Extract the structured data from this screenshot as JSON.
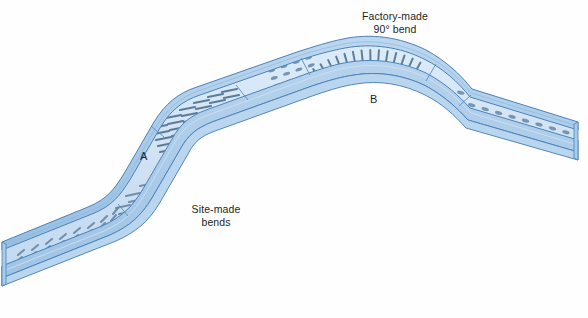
{
  "figure": {
    "title_visible": false,
    "background_color": "#fefefe",
    "labels": {
      "factory_bend_line1": "Factory-made",
      "factory_bend_line2": "90° bend",
      "site_bends_line1": "Site-made",
      "site_bends_line2": "bends",
      "point_a": "A",
      "point_b": "B"
    },
    "colors": {
      "tray_base_fill": "#cfe1f3",
      "tray_base_fill_light": "#dceaf7",
      "tray_rail_fill": "#aecde9",
      "tray_rail_fill_dark": "#9cc2e4",
      "tray_outline": "#4a82b8",
      "tray_outline_dark": "#3b6fa3",
      "slot_color": "#5c7f9e",
      "slot_color_dark": "#4a6b88",
      "joint_line": "#5d93c4",
      "text_color": "#1e1e20"
    },
    "geometry": {
      "segments": [
        {
          "name": "lower-left-straight-run",
          "type": "straight",
          "perforated": true
        },
        {
          "name": "site-bend-a-lower",
          "type": "bend",
          "perforated": true
        },
        {
          "name": "inclined-run",
          "type": "straight",
          "perforated": true
        },
        {
          "name": "site-bend-a-upper",
          "type": "bend",
          "perforated": true
        },
        {
          "name": "upper-left-straight-run",
          "type": "straight",
          "perforated": true
        },
        {
          "name": "factory-bend-b",
          "type": "bend",
          "perforated": true,
          "angle_degrees": 90
        },
        {
          "name": "right-descending-run",
          "type": "straight",
          "perforated": true
        }
      ],
      "joints": 4
    }
  }
}
